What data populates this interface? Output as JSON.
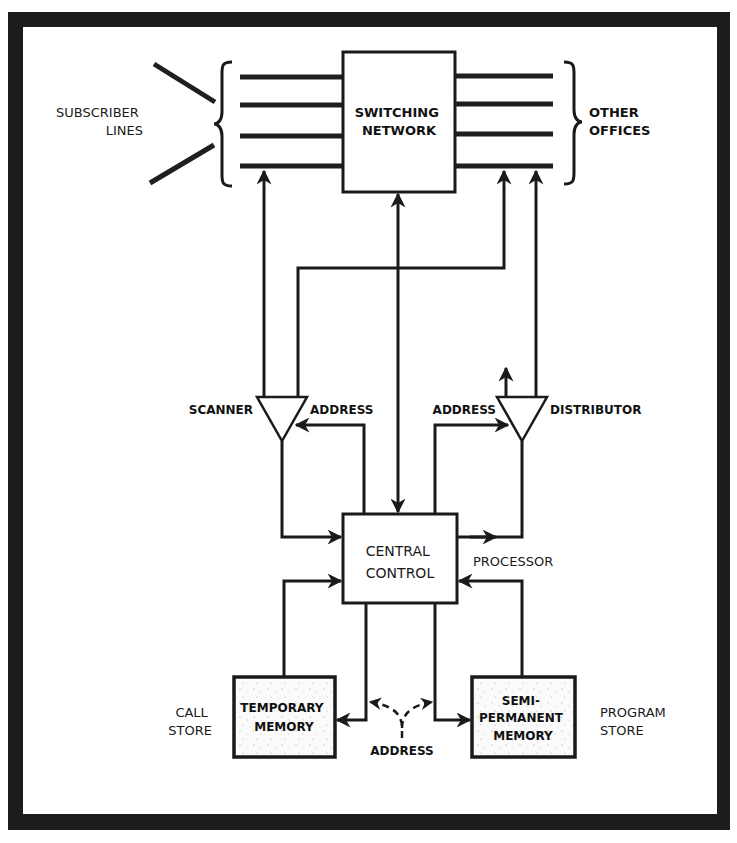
{
  "figure": {
    "type": "block-diagram",
    "colors": {
      "frame": "#1c1c1c",
      "background": "#ffffff",
      "ink": "#1a1a1a"
    }
  },
  "blocks": {
    "switching_network": {
      "line1": "SWITCHING",
      "line2": "NETWORK"
    },
    "central_control": {
      "line1": "CENTRAL",
      "line2": "CONTROL"
    },
    "temporary_memory": {
      "line1": "TEMPORARY",
      "line2": "MEMORY"
    },
    "semi_permanent_memory": {
      "line1": "SEMI-",
      "line2": "PERMANENT",
      "line3": "MEMORY"
    }
  },
  "labels": {
    "subscriber_lines": {
      "line1": "SUBSCRIBER",
      "line2": "LINES"
    },
    "other_offices": {
      "line1": "OTHER",
      "line2": "OFFICES"
    },
    "scanner": "SCANNER",
    "scanner_address": "ADDRESS",
    "distributor": "DISTRIBUTOR",
    "distributor_address": "ADDRESS",
    "processor": "PROCESSOR",
    "call_store": {
      "line1": "CALL",
      "line2": "STORE"
    },
    "program_store": {
      "line1": "PROGRAM",
      "line2": "STORE"
    },
    "memory_address": "ADDRESS"
  },
  "connections": [
    {
      "from": "subscriber_lines",
      "to": "switching_network",
      "kind": "line-bundle",
      "count": 4
    },
    {
      "from": "switching_network",
      "to": "other_offices",
      "kind": "line-bundle",
      "count": 4
    },
    {
      "from": "scanner",
      "to": "subscriber_lines",
      "kind": "arrow"
    },
    {
      "from": "scanner",
      "to": "other_offices",
      "kind": "arrow"
    },
    {
      "from": "distributor",
      "to": "other_offices",
      "kind": "arrow"
    },
    {
      "from": "distributor",
      "to": "up",
      "kind": "arrow"
    },
    {
      "from": "central_control",
      "to": "switching_network",
      "kind": "bidirectional-arrow"
    },
    {
      "from": "central_control",
      "to": "scanner",
      "kind": "arrow",
      "label": "ADDRESS"
    },
    {
      "from": "scanner",
      "to": "central_control",
      "kind": "arrow"
    },
    {
      "from": "central_control",
      "to": "distributor",
      "kind": "arrow",
      "label": "ADDRESS"
    },
    {
      "from": "central_control",
      "to": "distributor",
      "kind": "arrow"
    },
    {
      "from": "temporary_memory",
      "to": "central_control",
      "kind": "arrow"
    },
    {
      "from": "semi_permanent_memory",
      "to": "central_control",
      "kind": "arrow"
    },
    {
      "from": "central_control",
      "to": "temporary_memory",
      "kind": "arrow",
      "label": "ADDRESS"
    },
    {
      "from": "central_control",
      "to": "semi_permanent_memory",
      "kind": "arrow",
      "label": "ADDRESS"
    }
  ]
}
